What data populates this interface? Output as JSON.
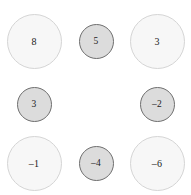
{
  "diagram": {
    "type": "bubble-grid",
    "background_color": "#ffffff",
    "width": 191,
    "height": 195,
    "rows": 3,
    "columns": 3,
    "styles": {
      "large": {
        "diameter": 55,
        "fill": "#f7f7f7",
        "stroke": "#d5d5d5"
      },
      "small": {
        "diameter": 35,
        "fill": "#dcdcdc",
        "stroke": "#6f6f6f"
      }
    },
    "cells": [
      {
        "row": 0,
        "col": 0,
        "value": "8",
        "size": "large",
        "empty": false
      },
      {
        "row": 0,
        "col": 1,
        "value": "5",
        "size": "small",
        "empty": false
      },
      {
        "row": 0,
        "col": 2,
        "value": "3",
        "size": "large",
        "empty": false
      },
      {
        "row": 1,
        "col": 0,
        "value": "3",
        "size": "small",
        "empty": false
      },
      {
        "row": 1,
        "col": 1,
        "value": "",
        "size": "none",
        "empty": true
      },
      {
        "row": 1,
        "col": 2,
        "value": "–2",
        "size": "small",
        "empty": false
      },
      {
        "row": 2,
        "col": 0,
        "value": "–1",
        "size": "large",
        "empty": false
      },
      {
        "row": 2,
        "col": 1,
        "value": "–4",
        "size": "small",
        "empty": false
      },
      {
        "row": 2,
        "col": 2,
        "value": "–6",
        "size": "large",
        "empty": false
      }
    ]
  }
}
